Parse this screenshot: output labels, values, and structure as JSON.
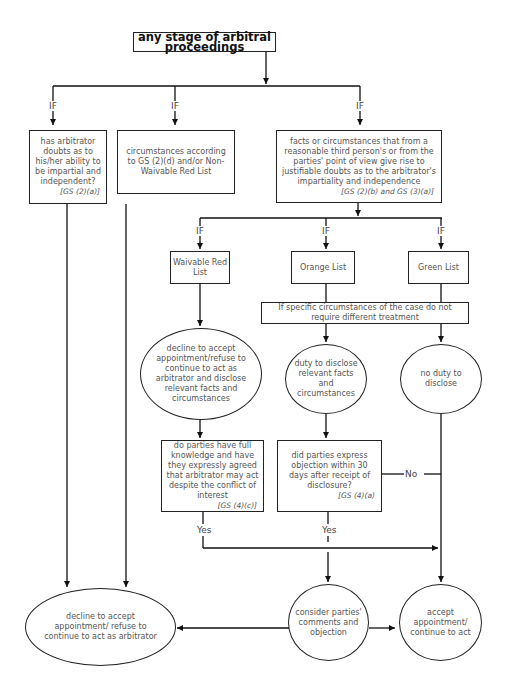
{
  "diagram": {
    "title": "any stage of arbitral proceedings",
    "branch_label": "IF",
    "nodes": {
      "doubts": {
        "text": "has arbitrator doubts as to his/her ability to be impartial and independent?",
        "ref": "[GS (2)(a)]"
      },
      "non_waivable": {
        "text": "circumstances according to GS (2)(d) and/or Non-Waivable Red List"
      },
      "facts": {
        "text": "facts or circumstances that from a reasonable third person's or from the parties' point of view give rise to justifiable doubts as to the arbitrator's impartiality and independence",
        "ref": "[GS (2)(b) and GS (3)(a)]"
      },
      "waivable_red": {
        "text": "Waivable Red List"
      },
      "orange": {
        "text": "Orange List"
      },
      "green": {
        "text": "Green List"
      },
      "specific": {
        "text": "If specific circumstances of the case do not require different treatment"
      },
      "decline_disclose": {
        "text": "decline to accept appointment/refuse to continue to act as arbitrator and disclose relevant facts and circumstances"
      },
      "duty_disclose": {
        "text": "duty to disclose relevant facts and circumstances"
      },
      "no_duty": {
        "text": "no duty to disclose"
      },
      "full_knowledge": {
        "text": "do parties have full knowledge and have they expressly agreed that arbitrator may act despite the conflict of interest",
        "ref": "[GS (4)(c)]"
      },
      "objection": {
        "text": "did parties express objection within 30 days after receipt of disclosure?",
        "ref": "[GS (4)(a)"
      },
      "decline_final": {
        "text": "decline to accept appointment/ refuse to continue to act as arbitrator"
      },
      "consider": {
        "text": "consider parties' comments and objection"
      },
      "accept": {
        "text": "accept appointment/ continue to act"
      }
    },
    "edge_labels": {
      "yes": "Yes",
      "no": "No"
    }
  }
}
